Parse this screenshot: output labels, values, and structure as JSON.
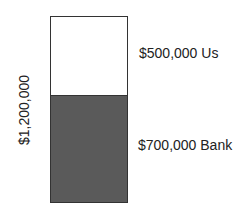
{
  "chart_data": {
    "type": "bar",
    "stacked": true,
    "title": "",
    "xlabel": "",
    "ylabel": "$1,200,000",
    "categories": [
      "Total"
    ],
    "series": [
      {
        "name": "Bank",
        "label": "$700,000 Bank",
        "values": [
          700000
        ],
        "color": "#5a5a5a"
      },
      {
        "name": "Us",
        "label": "$500,000 Us",
        "values": [
          500000
        ],
        "color": "#ffffff"
      }
    ],
    "total": 1200000,
    "grid": false,
    "legend": "inline-right"
  },
  "labels": {
    "total": "$1,200,000",
    "top": "$500,000 Us",
    "bottom": "$700,000 Bank"
  }
}
